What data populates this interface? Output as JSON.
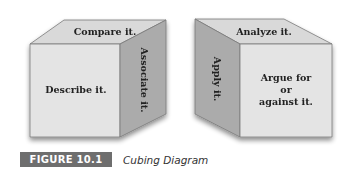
{
  "diagram": {
    "title": "Cubing Diagram",
    "colors": {
      "front": "#e4e4e4",
      "top": "#d9d9d9",
      "side": "#aaaaaa",
      "edge": "#7a7a7a",
      "caption_bg": "#6e6e6e"
    },
    "cubes": [
      {
        "id": "left-cube",
        "top": "Compare it.",
        "front": "Describe it.",
        "side": "Associate it."
      },
      {
        "id": "right-cube",
        "top": "Analyze it.",
        "front_lines": [
          "Argue for",
          "or",
          "against it."
        ],
        "side": "Apply it."
      }
    ]
  },
  "caption": {
    "label": "FIGURE 10.1",
    "title": "Cubing Diagram"
  }
}
